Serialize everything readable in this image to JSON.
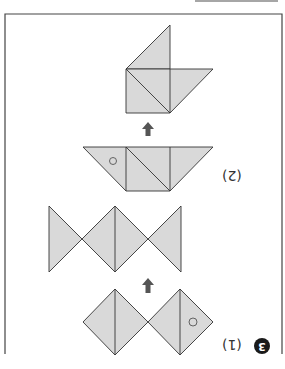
{
  "page": {
    "orientation": "rotated-180",
    "problem_number": "3",
    "parts": [
      {
        "label": "(1)",
        "description": "Two diamonds (each made of two triangles) folded/transformed into bowtie shape"
      },
      {
        "label": "(2)",
        "description": "Trapezoid of triangles and square transformed into boat-like shape"
      }
    ],
    "colors": {
      "fill": "#d9d9d9",
      "stroke": "#333333",
      "arrow": "#555555",
      "frame": "#444444"
    },
    "marks": {
      "circle_marker": "○",
      "arrow_direction": "up"
    }
  }
}
